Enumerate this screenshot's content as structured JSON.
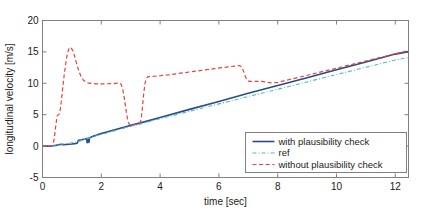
{
  "chart_data": {
    "type": "line",
    "title": "",
    "xlabel": "time [sec]",
    "ylabel": "longitudinal velocity [m/s]",
    "xlim": [
      0,
      12.45
    ],
    "ylim": [
      -5,
      20
    ],
    "xticks": [
      0,
      2,
      4,
      6,
      8,
      10,
      12
    ],
    "xticklabels": [
      "0",
      "2",
      "4",
      "6",
      "8",
      "10",
      "12"
    ],
    "yticks": [
      -5,
      0,
      5,
      10,
      15,
      20
    ],
    "yticklabels": [
      "-5",
      "0",
      "5",
      "10",
      "15",
      "20"
    ],
    "grid": false,
    "legend_position": "lower right",
    "series": [
      {
        "name": "with plausibility check",
        "color": "#2b4a8b",
        "style": "solid",
        "width": 1.6,
        "points": [
          [
            0.0,
            0.0
          ],
          [
            0.3,
            0.0
          ],
          [
            0.36,
            0.05
          ],
          [
            0.45,
            0.12
          ],
          [
            0.55,
            0.22
          ],
          [
            0.62,
            0.3
          ],
          [
            0.7,
            0.22
          ],
          [
            0.8,
            0.26
          ],
          [
            0.9,
            0.3
          ],
          [
            1.0,
            0.34
          ],
          [
            1.1,
            0.4
          ],
          [
            1.18,
            0.46
          ],
          [
            1.22,
            0.92
          ],
          [
            1.28,
            0.98
          ],
          [
            1.34,
            1.02
          ],
          [
            1.4,
            1.08
          ],
          [
            1.46,
            1.14
          ],
          [
            1.5,
            1.2
          ],
          [
            1.52,
            0.55
          ],
          [
            1.55,
            1.28
          ],
          [
            1.58,
            0.58
          ],
          [
            1.6,
            1.34
          ],
          [
            1.64,
            1.4
          ],
          [
            1.7,
            1.52
          ],
          [
            1.8,
            1.68
          ],
          [
            2.0,
            2.0
          ],
          [
            2.4,
            2.52
          ],
          [
            2.8,
            3.05
          ],
          [
            3.1,
            3.42
          ],
          [
            3.4,
            3.78
          ],
          [
            4.0,
            4.55
          ],
          [
            5.0,
            5.85
          ],
          [
            6.0,
            7.1
          ],
          [
            7.0,
            8.4
          ],
          [
            8.0,
            9.65
          ],
          [
            9.0,
            10.9
          ],
          [
            10.0,
            12.15
          ],
          [
            11.0,
            13.4
          ],
          [
            12.0,
            14.65
          ],
          [
            12.45,
            15.05
          ]
        ]
      },
      {
        "name": "ref",
        "color": "#55b9bd",
        "style": "dashdot",
        "width": 1.1,
        "points": [
          [
            0.0,
            0.0
          ],
          [
            0.35,
            0.0
          ],
          [
            0.6,
            0.3
          ],
          [
            0.9,
            0.45
          ],
          [
            1.2,
            0.7
          ],
          [
            1.5,
            1.15
          ],
          [
            1.8,
            1.6
          ],
          [
            2.2,
            2.1
          ],
          [
            2.8,
            2.9
          ],
          [
            3.4,
            3.62
          ],
          [
            4.0,
            4.35
          ],
          [
            5.0,
            5.55
          ],
          [
            6.0,
            6.72
          ],
          [
            7.0,
            7.9
          ],
          [
            8.0,
            9.05
          ],
          [
            9.0,
            10.22
          ],
          [
            10.0,
            11.4
          ],
          [
            11.0,
            12.55
          ],
          [
            12.0,
            13.72
          ],
          [
            12.45,
            14.1
          ]
        ]
      },
      {
        "name": "without plausibility check",
        "color": "#e8413c",
        "style": "dashed",
        "width": 1.2,
        "points": [
          [
            0.0,
            0.0
          ],
          [
            0.3,
            0.0
          ],
          [
            0.35,
            0.15
          ],
          [
            0.4,
            1.2
          ],
          [
            0.45,
            3.2
          ],
          [
            0.5,
            4.85
          ],
          [
            0.55,
            5.05
          ],
          [
            0.58,
            5.15
          ],
          [
            0.62,
            6.3
          ],
          [
            0.66,
            8.0
          ],
          [
            0.7,
            9.8
          ],
          [
            0.74,
            11.4
          ],
          [
            0.78,
            12.8
          ],
          [
            0.82,
            14.0
          ],
          [
            0.86,
            14.95
          ],
          [
            0.9,
            15.55
          ],
          [
            0.94,
            15.72
          ],
          [
            0.98,
            15.6
          ],
          [
            1.04,
            15.1
          ],
          [
            1.1,
            14.2
          ],
          [
            1.16,
            13.1
          ],
          [
            1.24,
            11.9
          ],
          [
            1.32,
            11.0
          ],
          [
            1.4,
            10.45
          ],
          [
            1.5,
            10.12
          ],
          [
            1.6,
            10.0
          ],
          [
            1.8,
            9.92
          ],
          [
            2.1,
            9.92
          ],
          [
            2.4,
            9.95
          ],
          [
            2.55,
            10.02
          ],
          [
            2.62,
            10.05
          ],
          [
            2.68,
            9.8
          ],
          [
            2.72,
            9.2
          ],
          [
            2.76,
            8.3
          ],
          [
            2.8,
            7.1
          ],
          [
            2.84,
            5.8
          ],
          [
            2.88,
            4.6
          ],
          [
            2.92,
            3.8
          ],
          [
            2.96,
            3.42
          ],
          [
            3.02,
            3.32
          ],
          [
            3.1,
            3.4
          ],
          [
            3.18,
            3.52
          ],
          [
            3.26,
            3.62
          ],
          [
            3.32,
            3.7
          ],
          [
            3.36,
            4.4
          ],
          [
            3.4,
            6.2
          ],
          [
            3.44,
            8.2
          ],
          [
            3.48,
            9.8
          ],
          [
            3.52,
            10.7
          ],
          [
            3.58,
            11.02
          ],
          [
            3.66,
            11.1
          ],
          [
            3.8,
            11.12
          ],
          [
            4.0,
            11.2
          ],
          [
            4.3,
            11.35
          ],
          [
            4.6,
            11.55
          ],
          [
            5.0,
            11.8
          ],
          [
            5.4,
            12.05
          ],
          [
            5.8,
            12.3
          ],
          [
            6.2,
            12.55
          ],
          [
            6.55,
            12.75
          ],
          [
            6.7,
            12.82
          ],
          [
            6.78,
            12.6
          ],
          [
            6.84,
            11.9
          ],
          [
            6.9,
            11.1
          ],
          [
            6.96,
            10.55
          ],
          [
            7.02,
            10.32
          ],
          [
            7.2,
            10.3
          ],
          [
            7.45,
            10.32
          ],
          [
            7.6,
            10.2
          ],
          [
            7.8,
            10.05
          ],
          [
            8.0,
            10.15
          ],
          [
            8.4,
            10.6
          ],
          [
            8.8,
            11.05
          ],
          [
            9.2,
            11.5
          ],
          [
            9.6,
            11.95
          ],
          [
            10.0,
            12.4
          ],
          [
            10.5,
            12.98
          ],
          [
            11.0,
            13.55
          ],
          [
            11.5,
            14.12
          ],
          [
            12.0,
            14.7
          ],
          [
            12.45,
            15.2
          ]
        ]
      }
    ]
  },
  "legend": {
    "entries": [
      {
        "label": "with plausibility check"
      },
      {
        "label": "ref"
      },
      {
        "label": "without plausibility check"
      }
    ]
  }
}
